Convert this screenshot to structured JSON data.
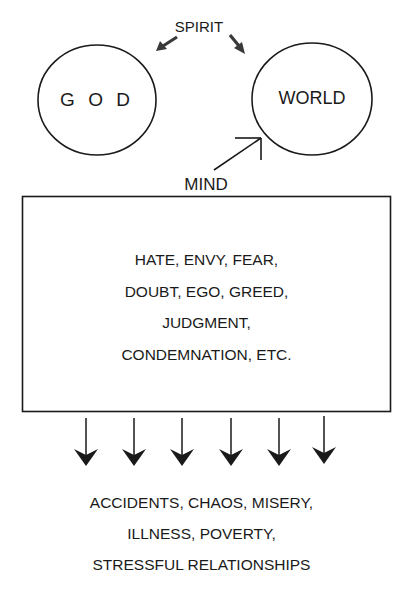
{
  "diagram": {
    "top_label": "SPIRIT",
    "nodes": {
      "god": "G O D",
      "world": "WORLD"
    },
    "mind_label": "MIND",
    "mind_box_lines": [
      "HATE, ENVY, FEAR,",
      "DOUBT, EGO, GREED,",
      "JUDGMENT,",
      "CONDEMNATION, ETC."
    ],
    "down_arrow_count": 6,
    "outcome_lines": [
      "ACCIDENTS, CHAOS, MISERY,",
      "ILLNESS, POVERTY,",
      "STRESSFUL RELATIONSHIPS"
    ],
    "colors": {
      "stroke": "#1a1a1a",
      "background": "#ffffff",
      "spirit_arrow": "#3a3a3a"
    }
  }
}
